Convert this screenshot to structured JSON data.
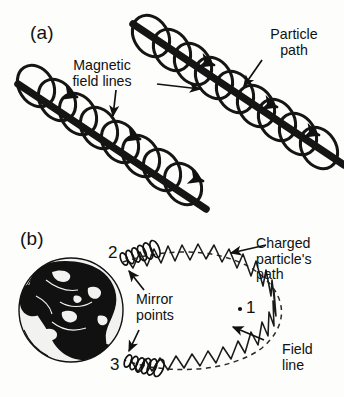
{
  "figure": {
    "panels": [
      {
        "id": "a",
        "label": "(a)",
        "annotations": [
          {
            "name": "magnetic-field-lines",
            "text": "Magnetic\nfield lines"
          },
          {
            "name": "particle-path",
            "text": "Particle\npath"
          }
        ]
      },
      {
        "id": "b",
        "label": "(b)",
        "annotations": [
          {
            "name": "charged-particles-path",
            "text": "Charged\nparticle's\npath"
          },
          {
            "name": "mirror-points",
            "text": "Mirror\npoints"
          },
          {
            "name": "field-line",
            "text": "Field\nline"
          }
        ],
        "markers": [
          {
            "name": "marker-1",
            "text": "1"
          },
          {
            "name": "marker-2",
            "text": "2"
          },
          {
            "name": "marker-3",
            "text": "3"
          }
        ]
      }
    ],
    "colors": {
      "ink": "#111111",
      "background": "#fdfdfc",
      "field_line_thick": "#151515",
      "globe_land": "#111111",
      "globe_ocean": "#f2f2f0"
    }
  }
}
